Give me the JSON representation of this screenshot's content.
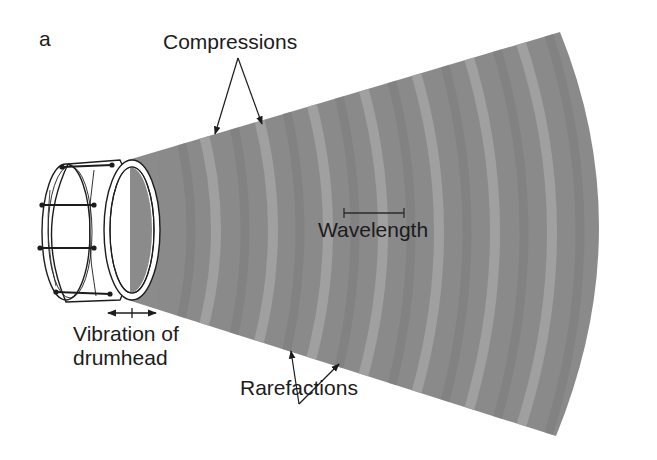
{
  "figure": {
    "panel_label": "a",
    "labels": {
      "compressions": "Compressions",
      "wavelength": "Wavelength",
      "vibration_line1": "Vibration of",
      "vibration_line2": "drumhead",
      "rarefactions": "Rarefactions"
    },
    "colors": {
      "background": "#ffffff",
      "wave_base": "#8b8b8b",
      "wave_band_light": "#a6a6a6",
      "wave_band_dark": "#7f7f7f",
      "ink": "#1c1c1c",
      "drum_fill": "#ffffff"
    },
    "elements": [
      "drum",
      "sound-wave-cone",
      "compression-arrows",
      "rarefaction-arrows",
      "wavelength-bar",
      "vibration-double-arrow"
    ]
  }
}
